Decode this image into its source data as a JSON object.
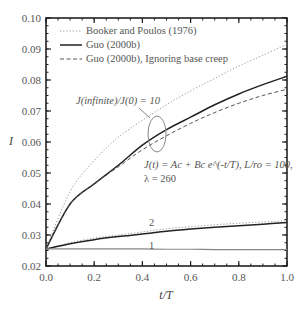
{
  "chart_data": {
    "type": "line",
    "title": "",
    "xlabel": "t/T",
    "ylabel": "I",
    "xlim": [
      0.0,
      1.0
    ],
    "ylim": [
      0.02,
      0.1
    ],
    "xticks": [
      "0.0",
      "0.2",
      "0.4",
      "0.6",
      "0.8",
      "1.0"
    ],
    "yticks": [
      "0.02",
      "0.03",
      "0.04",
      "0.05",
      "0.06",
      "0.07",
      "0.08",
      "0.09",
      "0.10"
    ],
    "grid": false,
    "legend_position": "upper left",
    "legend": [
      {
        "label": "Booker and Poulos (1976)",
        "style": "dotted"
      },
      {
        "label": "Guo (2000b)",
        "style": "solid"
      },
      {
        "label": "Guo (2000b), Ignoring base creep",
        "style": "dashed"
      }
    ],
    "annotations": {
      "ratio_label": "J(infinite)/J(0) = 10",
      "formula_line1": "J(t) = Ac + Bc e^(-t/T), L/ro = 100,",
      "formula_line2": "λ = 260",
      "curve_label_2": "2",
      "curve_label_1": "1"
    },
    "x": [
      0.0,
      0.1,
      0.2,
      0.3,
      0.4,
      0.5,
      0.6,
      0.7,
      0.8,
      0.9,
      1.0
    ],
    "series": [
      {
        "name": "Booker and Poulos (1976), ratio 10",
        "style": "dotted",
        "values": [
          0.0255,
          0.044,
          0.054,
          0.0615,
          0.067,
          0.072,
          0.0765,
          0.0805,
          0.0845,
          0.088,
          0.0915
        ]
      },
      {
        "name": "Guo (2000b), ratio 10",
        "style": "solid",
        "values": [
          0.0255,
          0.04,
          0.0465,
          0.0525,
          0.059,
          0.064,
          0.068,
          0.072,
          0.0755,
          0.0785,
          0.0812
        ]
      },
      {
        "name": "Guo (2000b) ignoring base creep, ratio 10",
        "style": "dashed",
        "values": [
          0.0255,
          0.04,
          0.0465,
          0.052,
          0.0575,
          0.062,
          0.066,
          0.0695,
          0.0725,
          0.075,
          0.077
        ]
      },
      {
        "name": "Booker and Poulos (1976), ratio 2",
        "style": "dotted",
        "values": [
          0.0255,
          0.0275,
          0.029,
          0.03,
          0.031,
          0.032,
          0.0327,
          0.0333,
          0.0338,
          0.0342,
          0.0346
        ]
      },
      {
        "name": "Guo (2000b), ratio 2",
        "style": "solid",
        "values": [
          0.0255,
          0.0272,
          0.0285,
          0.0295,
          0.0303,
          0.0312,
          0.0319,
          0.0325,
          0.033,
          0.0335,
          0.034
        ]
      },
      {
        "name": "ratio 1 (all methods)",
        "style": "solid-gray",
        "values": [
          0.0255,
          0.0255,
          0.0255,
          0.0255,
          0.0255,
          0.0254,
          0.0254,
          0.0253,
          0.0253,
          0.0253,
          0.0253
        ]
      }
    ]
  },
  "colors": {
    "axis": "#222222",
    "solid": "#222222",
    "dotted": "#999999",
    "dashed": "#555555",
    "ellipse": "#888888",
    "flat": "#888888"
  }
}
